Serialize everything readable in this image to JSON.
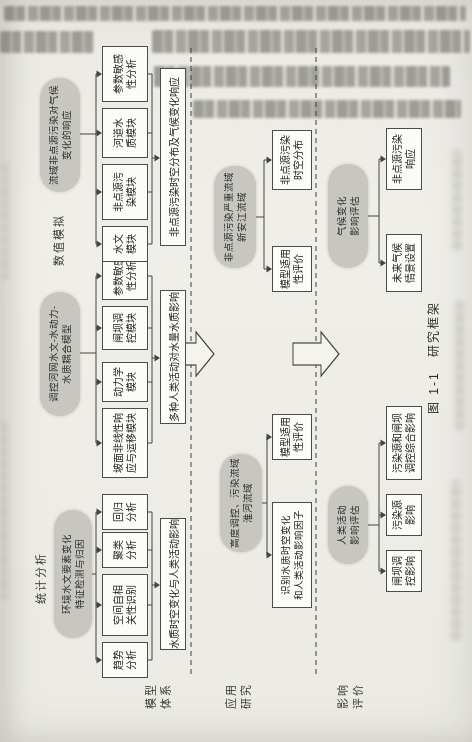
{
  "figure": {
    "caption": "图 1-1　研究框架",
    "row_labels": [
      "模型\n体系",
      "应用\n研究",
      "影响\n评价"
    ],
    "section_headers": {
      "statistical": "统计分析",
      "numerical": "数值模拟"
    },
    "model_band": {
      "statistical": {
        "source": "环境水文要素变化\n特征检测与归因",
        "modules": [
          "趋势\n分析",
          "空间自相\n关性识别",
          "聚类\n分析",
          "回归\n分析"
        ],
        "output": "水质时空变化与人类活动影响"
      },
      "coupled_model": {
        "source": "调控河网水文-水动力-\n水质耦合模型",
        "modules": [
          "坡面非线性响\n应与运移模块",
          "动力学\n模块",
          "闸坝调\n控模块",
          "参数敏感\n性分析"
        ],
        "output": "多种人类活动对水量水质影响"
      },
      "nps_model": {
        "source": "流域非点源污染对气候\n变化的响应",
        "modules": [
          "水文\n模块",
          "非点源污\n染模块",
          "河道水\n质模块",
          "参数敏感\n性分析"
        ],
        "output": "非点源污染时空分布及气候变化响应"
      }
    },
    "application_band": {
      "huai_basin": {
        "source": "高度调控、污染流域\n淮河流域",
        "results": [
          "识别水质时空变化\n和人类活动影响因子",
          "模型适用\n性评价"
        ]
      },
      "xinanjiang_basin": {
        "source": "非点源污染严重流域\n新安江流域",
        "results": [
          "模型适用\n性评价",
          "非点源污染\n时空分布"
        ]
      }
    },
    "impact_band": {
      "human_activity": {
        "source": "人类活动\n影响评估",
        "results": [
          "闸坝调\n控影响",
          "污染源\n影响",
          "污染源和闸坝\n调控综合影响"
        ]
      },
      "climate_change": {
        "source": "气候变化\n影响评估",
        "results": [
          "未来气候\n情景设置",
          "非点源污染\n响应"
        ]
      }
    },
    "colors": {
      "paper": "#ecebe6",
      "node_fill": "#c7c6c1",
      "box_border": "#4c4c45",
      "line": "#45453f"
    }
  }
}
